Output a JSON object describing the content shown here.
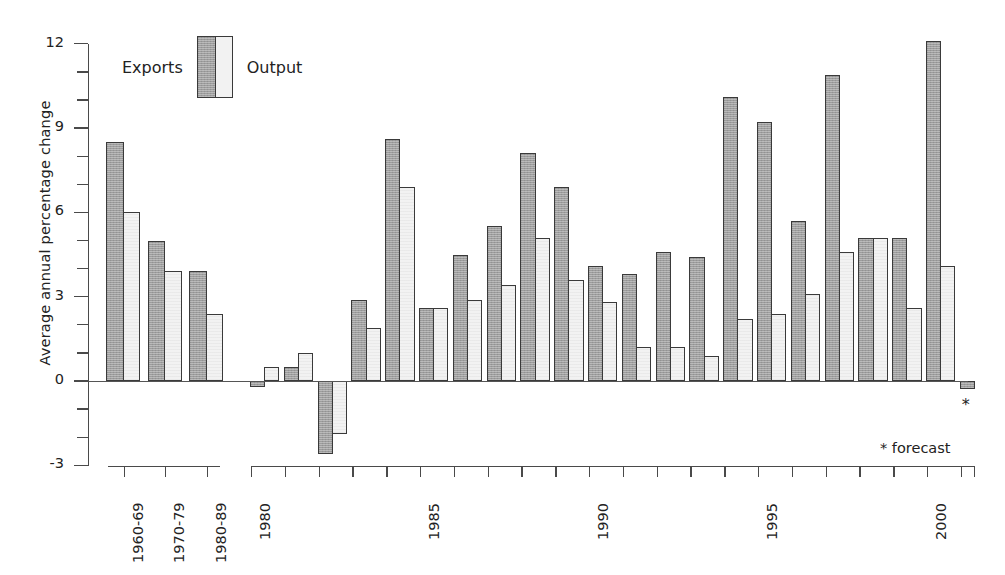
{
  "chart_data": {
    "type": "bar",
    "title": "",
    "xlabel": "",
    "ylabel": "Average annual percentage change",
    "ylim": [
      -3,
      12
    ],
    "ytick_labels": [
      "12",
      "9",
      "6",
      "3",
      "0",
      "-3"
    ],
    "ytick_values": [
      12,
      9,
      6,
      3,
      0,
      -3
    ],
    "minor_tick_step": 1,
    "grid": false,
    "legend": {
      "position": "top-left-inside",
      "entries": [
        {
          "name": "Exports",
          "style": "dark-hatched"
        },
        {
          "name": "Output",
          "style": "light"
        }
      ]
    },
    "panels": [
      {
        "id": "decades",
        "categories": [
          "1960-69",
          "1970-79",
          "1980-89"
        ],
        "tick_labels": [
          "1960-69",
          "1970-79",
          "1980-89"
        ],
        "series": [
          {
            "name": "Exports",
            "values": [
              8.5,
              5.0,
              3.9
            ]
          },
          {
            "name": "Output",
            "values": [
              6.0,
              3.9,
              2.4
            ]
          }
        ]
      },
      {
        "id": "annual",
        "categories": [
          "1980",
          "1981",
          "1982",
          "1983",
          "1984",
          "1985",
          "1986",
          "1987",
          "1988",
          "1989",
          "1990",
          "1991",
          "1992",
          "1993",
          "1994",
          "1995",
          "1996",
          "1997",
          "1998",
          "1999",
          "2000",
          "2001"
        ],
        "tick_labels": [
          "1980",
          "1985",
          "1990",
          "1995",
          "2000"
        ],
        "tick_label_years": [
          1980,
          1985,
          1990,
          1995,
          2000
        ],
        "series": [
          {
            "name": "Exports",
            "values": [
              -0.2,
              0.5,
              -2.6,
              2.9,
              8.6,
              2.6,
              4.5,
              5.5,
              8.1,
              6.9,
              4.1,
              3.8,
              4.6,
              4.4,
              10.1,
              9.2,
              5.7,
              10.9,
              5.1,
              5.1,
              12.1,
              -0.3
            ]
          },
          {
            "name": "Output",
            "values": [
              0.5,
              1.0,
              -1.9,
              1.9,
              6.9,
              2.6,
              2.9,
              3.4,
              5.1,
              3.6,
              2.8,
              1.2,
              1.2,
              0.9,
              2.2,
              2.4,
              3.1,
              4.6,
              5.1,
              2.6,
              4.1,
              null
            ]
          }
        ]
      }
    ],
    "annotations": [
      {
        "name": "forecast-star",
        "text": "*",
        "attached_to": "2001"
      },
      {
        "name": "forecast-legend",
        "text": "* forecast"
      }
    ]
  }
}
